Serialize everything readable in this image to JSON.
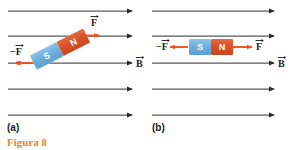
{
  "figure": {
    "caption": "Figura 8",
    "caption_color": "#e8842a",
    "panels": [
      {
        "id": "a",
        "label": "(a)",
        "magnet": {
          "orientation": "tilted",
          "rotation_deg": -27,
          "south_label": "S",
          "north_label": "N",
          "south_color": "#6fb0dd",
          "north_color": "#d9512a"
        },
        "force_arrows": [
          {
            "name": "force-positive",
            "label": "F",
            "direction": "right",
            "vector": true
          },
          {
            "name": "force-negative",
            "label": "−F",
            "direction": "left",
            "vector": true
          }
        ],
        "field": {
          "label": "B",
          "vector": true,
          "line_count": 5,
          "direction": "right",
          "color": "#58595b"
        }
      },
      {
        "id": "b",
        "label": "(b)",
        "magnet": {
          "orientation": "horizontal",
          "rotation_deg": 0,
          "south_label": "S",
          "north_label": "N",
          "south_color": "#6fb0dd",
          "north_color": "#d9512a"
        },
        "force_arrows": [
          {
            "name": "force-positive",
            "label": "F",
            "direction": "right",
            "vector": true
          },
          {
            "name": "force-negative",
            "label": "−F",
            "direction": "left",
            "vector": true
          }
        ],
        "field": {
          "label": "B",
          "vector": true,
          "line_count": 5,
          "direction": "right",
          "color": "#58595b"
        }
      }
    ],
    "colors": {
      "force_arrow": "#e8531f",
      "field_line": "#58595b",
      "text": "#1a1a1a",
      "background": "#ffffff"
    }
  }
}
